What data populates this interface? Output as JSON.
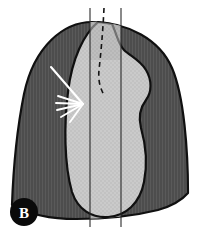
{
  "figure": {
    "panel_label": "B",
    "caption_visible": "",
    "width": 200,
    "height": 239
  },
  "colors": {
    "background": "#ffffff",
    "lung_field_dark": "#4d4d4d",
    "lung_field_dark_hatch": "#5c5c5c",
    "mediastinum_light": "#c9c9c9",
    "mediastinum_light_hatch": "#bfbfbf",
    "overlay_band": "#b2b2b2",
    "outline": "#101010",
    "marker_white": "#ffffff",
    "panel_letter_disc": "#0a0a0a",
    "panel_letter_glyph": "#ffffff",
    "thin_line": "#2a2a2a"
  },
  "regions": [
    {
      "name": "lung-field",
      "label": "lung-field-dark-hatched",
      "fill": "#4d4d4d",
      "description": "Hemithorax lung field, dark grey with fine vertical hatching"
    },
    {
      "name": "mediastinal-silhouette",
      "label": "mediastinal-cardiac-silhouette-light",
      "fill": "#c9c9c9",
      "description": "Central bean shaped light grey mediastinal / cardiac silhouette with right sided bulge"
    },
    {
      "name": "vertical-band",
      "label": "translucent-vertical-band",
      "fill": "#b2b2b2",
      "description": "Vertical translucent strip between the two reference lines"
    }
  ],
  "annotations": {
    "arrow": {
      "name": "white-arrow-pointer",
      "color": "#ffffff",
      "description": "Long white pointer line from upper left directed toward the mediastinal border"
    },
    "converging_lines": {
      "name": "white-converging-line-fan",
      "color": "#ffffff",
      "count": 5,
      "description": "Fan of short white converging lines at the arrow tip"
    },
    "dashed_line": {
      "name": "dashed-reference-line",
      "color": "#1a1a1a",
      "dash": "5 4",
      "description": "Dashed reference line descending through the upper mediastinum"
    },
    "reference_lines": [
      {
        "name": "left-reference-line",
        "x": 90,
        "y_top": 8,
        "y_bottom": 227
      },
      {
        "name": "right-reference-line",
        "x": 121,
        "y_top": 8,
        "y_bottom": 227
      }
    ]
  },
  "panel_badge": {
    "letter": "B",
    "cx": 24,
    "cy": 212,
    "r": 14
  }
}
